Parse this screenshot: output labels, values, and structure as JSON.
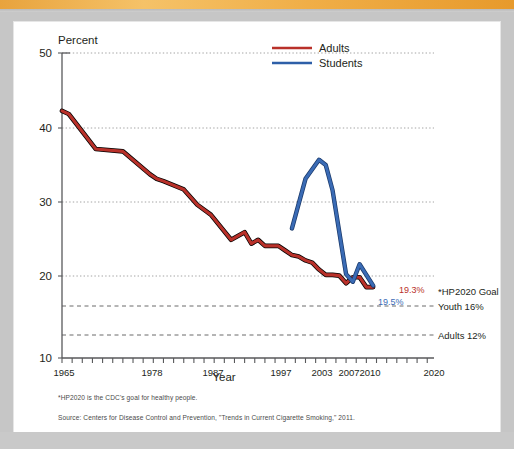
{
  "figure": {
    "y_axis_title": "Percent",
    "x_axis_title": "Year",
    "footnote": "*HP2020 is the CDC's goal for healthy people.",
    "source": "Source: Centers for Disease Control and Prevention, \"Trends in Current Cigarette Smoking,\" 2011."
  },
  "legend": {
    "items": [
      {
        "label": "Adults",
        "color": "#b9312a"
      },
      {
        "label": "Students",
        "color": "#2e5fa8"
      }
    ]
  },
  "annotations": [
    {
      "name": "adults-endpoint",
      "text": "19.3%",
      "color": "#b9312a"
    },
    {
      "name": "students-endpoint",
      "text": "19.5%",
      "color": "#3a6bb5"
    },
    {
      "name": "hp2020-goal",
      "text": "*HP2020 Goal",
      "color": "#231f20"
    },
    {
      "name": "youth-goal",
      "text": "Youth 16%",
      "color": "#231f20",
      "value": 16
    },
    {
      "name": "adults-goal",
      "text": "Adults 12%",
      "color": "#231f20",
      "value": 12
    }
  ],
  "chart_data": {
    "type": "line",
    "title": "",
    "xlabel": "Year",
    "ylabel": "Percent",
    "xlim": [
      1965,
      2020
    ],
    "ylim": [
      10,
      50
    ],
    "yticks": [
      10,
      20,
      30,
      40,
      50
    ],
    "xticks": [
      1965,
      1978,
      1987,
      1997,
      2003,
      2007,
      2010,
      2020
    ],
    "grid": "horizontal-dotted",
    "legend_position": "top-center",
    "series": [
      {
        "name": "Adults",
        "color": "#b9312a",
        "x": [
          1965,
          1966,
          1970,
          1974,
          1978,
          1979,
          1980,
          1983,
          1985,
          1987,
          1990,
          1992,
          1993,
          1994,
          1995,
          1997,
          1998,
          1999,
          2000,
          2001,
          2002,
          2003,
          2004,
          2005,
          2006,
          2007,
          2008,
          2009,
          2010,
          2011
        ],
        "y": [
          42.4,
          42.0,
          37.4,
          37.1,
          34.1,
          33.5,
          33.2,
          32.1,
          30.1,
          28.8,
          25.5,
          26.5,
          25.0,
          25.5,
          24.7,
          24.7,
          24.1,
          23.5,
          23.3,
          22.8,
          22.5,
          21.6,
          20.9,
          20.9,
          20.8,
          19.8,
          20.6,
          20.6,
          19.3,
          19.3
        ]
      },
      {
        "name": "Students",
        "color": "#2e5fa8",
        "x": [
          1999,
          2001,
          2003,
          2004,
          2005,
          2007,
          2008,
          2009,
          2011
        ],
        "y": [
          27.0,
          33.5,
          36.0,
          35.3,
          32.0,
          21.0,
          20.0,
          22.3,
          19.5
        ]
      }
    ],
    "reference_lines": [
      {
        "label": "Youth 16%",
        "value": 16,
        "style": "dashed"
      },
      {
        "label": "Adults 12%",
        "value": 12,
        "style": "dashed"
      }
    ]
  }
}
